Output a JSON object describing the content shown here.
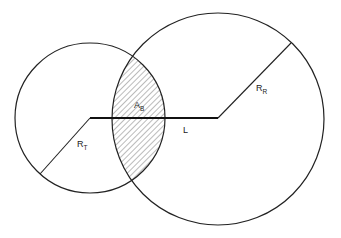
{
  "diagram": {
    "type": "intersecting-circles",
    "colors": {
      "stroke": "#222222",
      "background": "#ffffff",
      "hatch": "#444444"
    },
    "circles": [
      {
        "id": "T",
        "cx": 90,
        "cy": 118,
        "r": 75
      },
      {
        "id": "R",
        "cx": 218,
        "cy": 119,
        "r": 106
      }
    ],
    "lines": {
      "L": {
        "x1": 90,
        "y1": 118,
        "x2": 218,
        "y2": 118
      },
      "RT": {
        "x1": 90,
        "y1": 118,
        "x2": 40,
        "y2": 174
      },
      "RR": {
        "x1": 218,
        "y1": 118,
        "x2": 291,
        "y2": 43
      }
    },
    "labels": {
      "ab": {
        "main": "A",
        "sub": "B"
      },
      "rt": {
        "main": "R",
        "sub": "T"
      },
      "rr": {
        "main": "R",
        "sub": "R"
      },
      "l": {
        "main": "L"
      }
    }
  }
}
